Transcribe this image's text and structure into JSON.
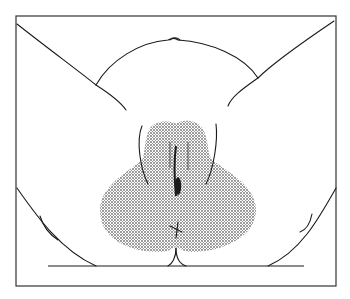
{
  "figure": {
    "type": "anatomical line illustration",
    "caption": "",
    "colors": {
      "background": "#ffffff",
      "line": "#1a1a1a",
      "frame": "#333333",
      "shaded_region": "#9a9a9a"
    },
    "elements": [
      {
        "name": "frame-border"
      },
      {
        "name": "body-outline"
      },
      {
        "name": "shaded-region",
        "fill": "stippled"
      },
      {
        "name": "ground-line"
      }
    ]
  }
}
